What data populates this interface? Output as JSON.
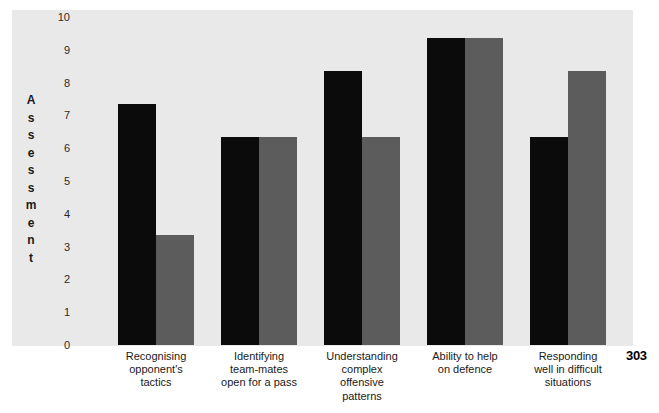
{
  "page": {
    "page_number": "303"
  },
  "chart_data": {
    "type": "bar",
    "title": "",
    "subtitle": "",
    "xlabel": "",
    "ylabel": "Assessment",
    "ylim": [
      0,
      10
    ],
    "ytick_labels": [
      "10",
      "9",
      "8",
      "7",
      "6",
      "5",
      "4",
      "3",
      "2",
      "1",
      "0"
    ],
    "grid": false,
    "legend": false,
    "legend_position": "none",
    "categories": [
      "Recognising opponent's tactics",
      "Identifying team-mates open for a pass",
      "Understanding complex offensive patterns",
      "Ability to help on defence",
      "Responding well in difficult situations"
    ],
    "category_lines": [
      [
        "Recognising",
        "opponent's",
        "tactics"
      ],
      [
        "Identifying",
        "team-mates",
        "open for a pass"
      ],
      [
        "Understanding",
        "complex",
        "offensive",
        "patterns"
      ],
      [
        "Ability to help",
        "on defence"
      ],
      [
        "Responding",
        "well in difficult",
        "situations"
      ]
    ],
    "series": [
      {
        "name": "series-1",
        "color": "#0b0b0b",
        "values": [
          7.35,
          6.35,
          8.35,
          9.35,
          6.35
        ]
      },
      {
        "name": "series-2",
        "color": "#5c5c5c",
        "values": [
          3.35,
          6.35,
          6.35,
          9.35,
          8.35
        ]
      }
    ],
    "colors": {
      "series_1": "#0b0b0b",
      "series_2": "#5c5c5c",
      "plot_background": "#e9e9e9",
      "page_background": "#ffffff",
      "text": "#1a1a1a"
    }
  }
}
